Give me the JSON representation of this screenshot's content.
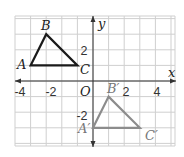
{
  "figure": {
    "type": "coordinate-plane-translation",
    "x_axis_label": "x",
    "y_axis_label": "y",
    "origin_label": "O",
    "x_tick_labels": [
      "-4",
      "-2",
      "2",
      "4"
    ],
    "y_tick_labels": [
      "2",
      "-2"
    ],
    "grid": {
      "x_range": [
        -5,
        5
      ],
      "y_range": [
        -4,
        4
      ],
      "step": 1
    },
    "colors": {
      "original": "#1a1a1a",
      "image": "#8c8c8c",
      "grid": "#cfcfcf",
      "axis": "#333333"
    },
    "original_triangle": {
      "vertices": [
        {
          "label": "A",
          "x": -4,
          "y": 1
        },
        {
          "label": "B",
          "x": -3,
          "y": 3
        },
        {
          "label": "C",
          "x": -1,
          "y": 1
        }
      ]
    },
    "image_triangle": {
      "vertices": [
        {
          "label": "A′",
          "x": 0,
          "y": -3
        },
        {
          "label": "B′",
          "x": 1,
          "y": -1
        },
        {
          "label": "C′",
          "x": 3,
          "y": -3
        }
      ]
    }
  }
}
